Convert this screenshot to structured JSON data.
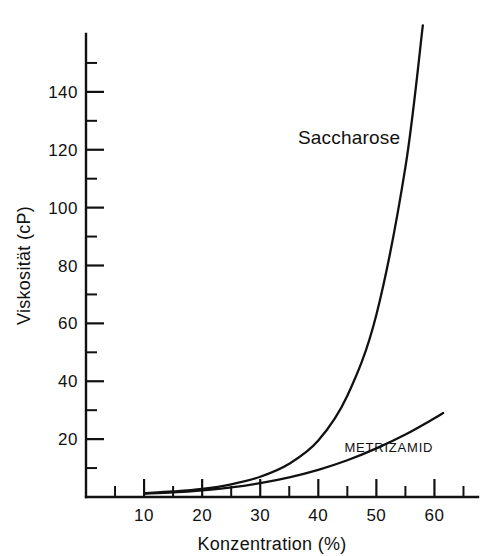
{
  "chart_data": {
    "type": "line",
    "title": "",
    "xlabel": "Konzentration (%)",
    "ylabel": "Viskosität (cP)",
    "xlim": [
      0,
      67.5
    ],
    "ylim": [
      0,
      160
    ],
    "grid": false,
    "legend_position": "inline-annotations",
    "x_major_ticks": [
      10,
      20,
      30,
      40,
      50,
      60
    ],
    "x_major_tick_labels": [
      "10",
      "20",
      "30",
      "40",
      "50",
      "60"
    ],
    "x_minor_ticks": [
      5,
      15,
      25,
      35,
      45,
      55,
      65
    ],
    "y_major_ticks": [
      20,
      40,
      60,
      80,
      100,
      120,
      140
    ],
    "y_major_tick_labels": [
      "20",
      "40",
      "60",
      "80",
      "100",
      "120",
      "140"
    ],
    "y_minor_ticks": [
      10,
      30,
      50,
      70,
      90,
      110,
      130,
      150
    ],
    "series": [
      {
        "name": "Saccharose",
        "label": "Saccharose",
        "label_x": 36.5,
        "label_y": 122,
        "x": [
          10,
          15,
          20,
          25,
          30,
          35,
          40,
          45,
          50,
          55,
          58
        ],
        "y": [
          1.3,
          1.9,
          2.8,
          4.4,
          7.0,
          11.5,
          19.5,
          35.0,
          63.0,
          114.0,
          163.0
        ]
      },
      {
        "name": "Metrizamid",
        "label": "METRIZAMID",
        "label_x": 44.5,
        "label_y": 15.5,
        "x": [
          10,
          15,
          20,
          25,
          30,
          35,
          40,
          45,
          50,
          55,
          60,
          61.5
        ],
        "y": [
          1.2,
          1.6,
          2.3,
          3.3,
          4.8,
          6.8,
          9.4,
          12.7,
          16.8,
          21.6,
          27.2,
          29.0
        ]
      }
    ],
    "colors": {
      "axis": "#111111",
      "curve": "#111111",
      "background": "#ffffff",
      "text": "#111111"
    }
  }
}
